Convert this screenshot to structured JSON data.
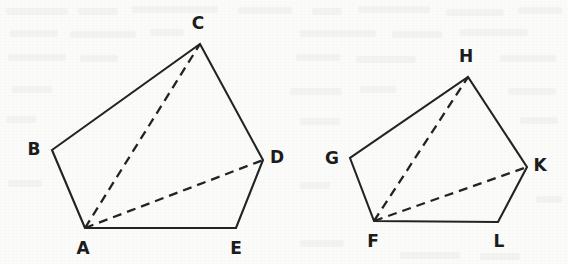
{
  "figure": {
    "width": 568,
    "height": 264,
    "background_color": "#fbfbfa",
    "ink_color": "#232323",
    "label_color": "#1c1c1c"
  },
  "shapes": [
    {
      "name": "pentagon-abcde",
      "label": "ABCDE",
      "vertices": [
        {
          "id": "A",
          "label": "A",
          "x": 85,
          "y": 228,
          "label_x": 83,
          "label_y": 249,
          "anchor": "middle"
        },
        {
          "id": "B",
          "label": "B",
          "x": 52,
          "y": 150,
          "label_x": 34,
          "label_y": 150,
          "anchor": "middle"
        },
        {
          "id": "C",
          "label": "C",
          "x": 200,
          "y": 44,
          "label_x": 198,
          "label_y": 24,
          "anchor": "middle"
        },
        {
          "id": "D",
          "label": "D",
          "x": 263,
          "y": 160,
          "label_x": 277,
          "label_y": 158,
          "anchor": "middle"
        },
        {
          "id": "E",
          "label": "E",
          "x": 236,
          "y": 228,
          "label_x": 236,
          "label_y": 249,
          "anchor": "middle"
        }
      ],
      "outline_order": [
        "A",
        "B",
        "C",
        "D",
        "E"
      ],
      "diagonals": [
        {
          "name": "diagonal-a-c",
          "from": "A",
          "to": "C",
          "style": "dashed"
        },
        {
          "name": "diagonal-a-d",
          "from": "A",
          "to": "D",
          "style": "dashed"
        }
      ]
    },
    {
      "name": "pentagon-fghkl",
      "label": "FGHKL",
      "vertices": [
        {
          "id": "F",
          "label": "F",
          "x": 374,
          "y": 221,
          "label_x": 373,
          "label_y": 242,
          "anchor": "middle"
        },
        {
          "id": "G",
          "label": "G",
          "x": 350,
          "y": 158,
          "label_x": 332,
          "label_y": 159,
          "anchor": "middle"
        },
        {
          "id": "H",
          "label": "H",
          "x": 468,
          "y": 77,
          "label_x": 466,
          "label_y": 57,
          "anchor": "middle"
        },
        {
          "id": "K",
          "label": "K",
          "x": 527,
          "y": 167,
          "label_x": 540,
          "label_y": 166,
          "anchor": "middle"
        },
        {
          "id": "L",
          "label": "L",
          "x": 498,
          "y": 222,
          "label_x": 499,
          "label_y": 242,
          "anchor": "middle"
        }
      ],
      "outline_order": [
        "F",
        "G",
        "H",
        "K",
        "L"
      ],
      "diagonals": [
        {
          "name": "diagonal-f-h",
          "from": "F",
          "to": "H",
          "style": "dashed"
        },
        {
          "name": "diagonal-f-k",
          "from": "F",
          "to": "K",
          "style": "dashed"
        }
      ]
    }
  ],
  "ghost_marks": [
    {
      "x": 6,
      "y": 8,
      "w": 62
    },
    {
      "x": 78,
      "y": 8,
      "w": 40
    },
    {
      "x": 132,
      "y": 6,
      "w": 86
    },
    {
      "x": 238,
      "y": 7,
      "w": 54
    },
    {
      "x": 312,
      "y": 8,
      "w": 30
    },
    {
      "x": 358,
      "y": 6,
      "w": 72
    },
    {
      "x": 446,
      "y": 9,
      "w": 58
    },
    {
      "x": 518,
      "y": 7,
      "w": 44
    },
    {
      "x": 10,
      "y": 30,
      "w": 48
    },
    {
      "x": 70,
      "y": 31,
      "w": 66
    },
    {
      "x": 150,
      "y": 29,
      "w": 34
    },
    {
      "x": 300,
      "y": 30,
      "w": 76
    },
    {
      "x": 392,
      "y": 31,
      "w": 50
    },
    {
      "x": 460,
      "y": 29,
      "w": 68
    },
    {
      "x": 8,
      "y": 54,
      "w": 58
    },
    {
      "x": 80,
      "y": 55,
      "w": 38
    },
    {
      "x": 296,
      "y": 54,
      "w": 44
    },
    {
      "x": 356,
      "y": 56,
      "w": 60
    },
    {
      "x": 500,
      "y": 55,
      "w": 56
    },
    {
      "x": 12,
      "y": 86,
      "w": 40
    },
    {
      "x": 290,
      "y": 88,
      "w": 52
    },
    {
      "x": 360,
      "y": 86,
      "w": 36
    },
    {
      "x": 508,
      "y": 88,
      "w": 48
    },
    {
      "x": 6,
      "y": 116,
      "w": 30
    },
    {
      "x": 300,
      "y": 118,
      "w": 40
    },
    {
      "x": 520,
      "y": 117,
      "w": 38
    },
    {
      "x": 8,
      "y": 180,
      "w": 34
    },
    {
      "x": 300,
      "y": 182,
      "w": 30
    },
    {
      "x": 536,
      "y": 196,
      "w": 26
    },
    {
      "x": 300,
      "y": 240,
      "w": 44
    },
    {
      "x": 400,
      "y": 252,
      "w": 60
    },
    {
      "x": 480,
      "y": 253,
      "w": 40
    }
  ]
}
